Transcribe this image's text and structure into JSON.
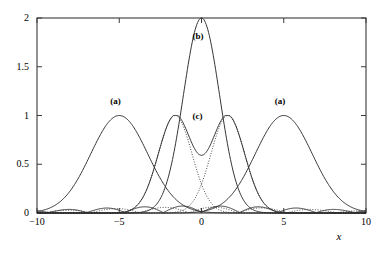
{
  "chart_data": {
    "type": "line",
    "title": "",
    "xlabel": "x",
    "ylabel": "",
    "xlim": [
      -10,
      10
    ],
    "ylim": [
      0,
      2
    ],
    "grid": false,
    "legend": "none",
    "xticks": [
      -10,
      -5,
      0,
      5,
      10
    ],
    "xtick_labels": [
      "−10",
      "−5",
      "0",
      "5",
      "10"
    ],
    "yticks": [
      0,
      0.5,
      1,
      1.5,
      2
    ],
    "ytick_labels": [
      "0",
      "0.5",
      "1",
      "1.5",
      "2"
    ],
    "annotations": [
      {
        "text": "(a)",
        "x": -5.0,
        "y": 1.13
      },
      {
        "text": "(b)",
        "x": 0.0,
        "y": 1.8
      },
      {
        "text": "(c)",
        "x": 0.0,
        "y": 0.97
      },
      {
        "text": "(a)",
        "x": 5.0,
        "y": 1.13
      }
    ],
    "series": [
      {
        "name": "(a) left packet",
        "style": "solid",
        "peak_x": -5.0,
        "peak_y": 1.0,
        "description": "Gaussian-like envelope centered at x = -5 reaching amplitude 1"
      },
      {
        "name": "(a) right packet",
        "style": "solid",
        "peak_x": 5.0,
        "peak_y": 1.0,
        "description": "Gaussian-like envelope centered at x = +5 reaching amplitude 1"
      },
      {
        "name": "(b) interference maximum",
        "style": "solid",
        "peak_x": 0.0,
        "peak_y": 2.0,
        "description": "Constructive-interference peak at x = 0 reaching amplitude 2"
      },
      {
        "name": "(c) split double peak",
        "style": "solid",
        "peak_x": [
          -1.6,
          1.6
        ],
        "peak_y": 1.0,
        "dip_x": 0.0,
        "dip_y": 0.82,
        "description": "Double-humped solid curve with peaks of 1 at x = ±1.6 and a dip to 0.82 at x = 0"
      },
      {
        "name": "dotted component left",
        "style": "dotted",
        "peak_x": -1.6,
        "peak_y": 1.0,
        "description": "Dotted component lobe peaking near x = -1.6, crossing the partner near x = 0"
      },
      {
        "name": "dotted component right",
        "style": "dotted",
        "peak_x": 1.6,
        "peak_y": 1.0,
        "description": "Dotted component lobe peaking near x = +1.6, crossing the partner near x = 0"
      },
      {
        "name": "baseline ripples (solid)",
        "style": "solid",
        "peak_y": 0.07,
        "description": "Small diffraction side-lobes oscillating close to zero across the full x range"
      },
      {
        "name": "baseline ripples (dotted)",
        "style": "dotted",
        "peak_y": 0.06,
        "description": "Dotted small side-lobes oscillating close to zero across the full x range"
      }
    ]
  },
  "axes": {
    "x_title": "x",
    "y_title": ""
  }
}
